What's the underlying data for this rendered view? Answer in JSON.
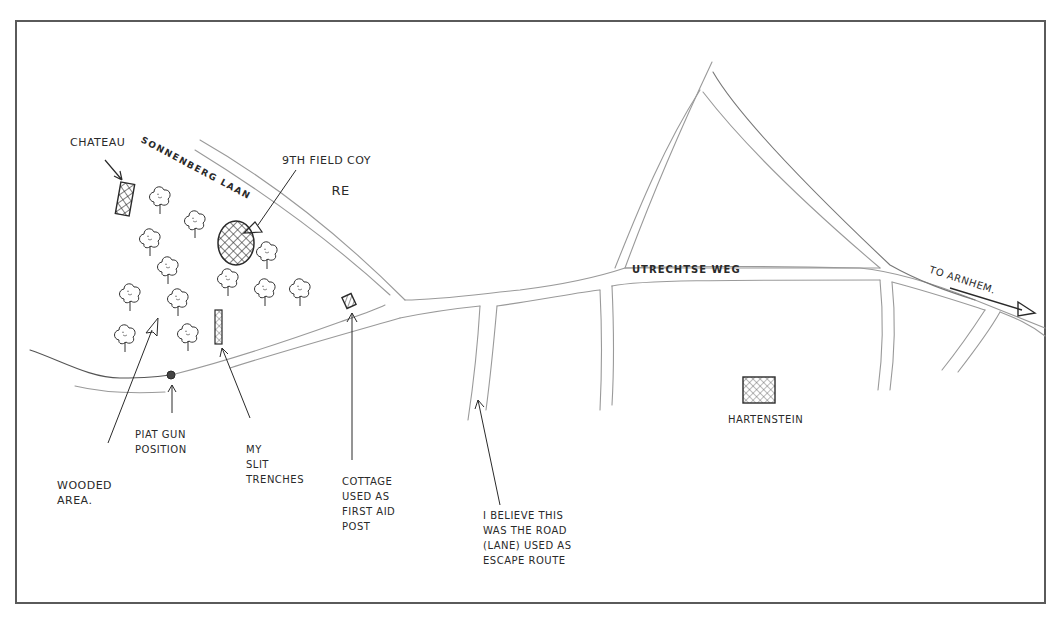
{
  "map": {
    "type": "hand-drawn sketch map",
    "colors": {
      "ink": "#2a2a2a",
      "road_pencil": "#9a9a9a",
      "frame": "#5a5a5a",
      "paper": "#ffffff"
    },
    "roads": [
      {
        "name": "Sonnenberg Laan",
        "label": "SONNENBERG LAAN"
      },
      {
        "name": "Utrechtse Weg",
        "label": "UTRECHTSE WEG"
      }
    ],
    "places": {
      "chateau": "CHATEAU",
      "field_coy_line1": "9TH FIELD COY",
      "field_coy_line2": "RE",
      "hartenstein": "HARTENSTEIN",
      "to_arnhem": "TO ARNHEM."
    },
    "annotations": {
      "wooded_area": "WOODED\nAREA.",
      "piat_gun": "PIAT GUN\nPOSITION",
      "slit_trenches": "MY\nSLIT\nTRENCHES",
      "cottage": "COTTAGE\nUSED AS\nFIRST AID\nPOST",
      "escape_route": "I BELIEVE THIS\nWAS THE ROAD\n(LANE) USED AS\nESCAPE ROUTE"
    }
  }
}
